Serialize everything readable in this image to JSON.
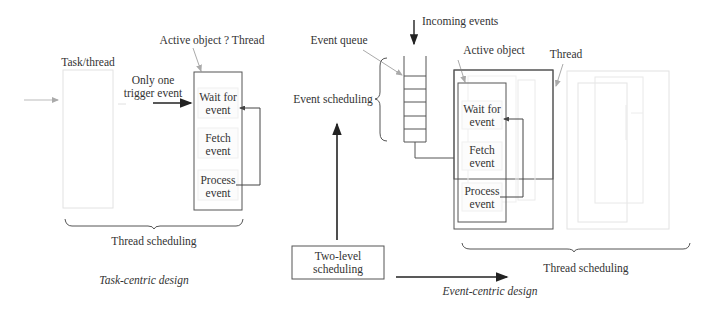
{
  "left_panel": {
    "caption": "Task-centric design",
    "task_label": "Task/thread",
    "active_label": "Active object ? Thread",
    "trigger_label_line1": "Only one",
    "trigger_label_line2": "trigger event",
    "steps": [
      {
        "line1": "Wait for",
        "line2": "event"
      },
      {
        "line1": "Fetch",
        "line2": "event"
      },
      {
        "line1": "Process",
        "line2": "event"
      }
    ],
    "brace_label": "Thread scheduling"
  },
  "right_panel": {
    "caption": "Event-centric design",
    "incoming_label": "Incoming events",
    "queue_label": "Event queue",
    "event_scheduling_label": "Event scheduling",
    "active_label": "Active object",
    "thread_label": "Thread",
    "steps": [
      {
        "line1": "Wait for",
        "line2": "event"
      },
      {
        "line1": "Fetch",
        "line2": "event"
      },
      {
        "line1": "Process",
        "line2": "event"
      }
    ],
    "two_level_line1": "Two-level",
    "two_level_line2": "scheduling",
    "brace_label": "Thread scheduling"
  },
  "colors": {
    "dark_line": "#555555",
    "faint_line": "#dddddd",
    "arrow": "#222222"
  }
}
